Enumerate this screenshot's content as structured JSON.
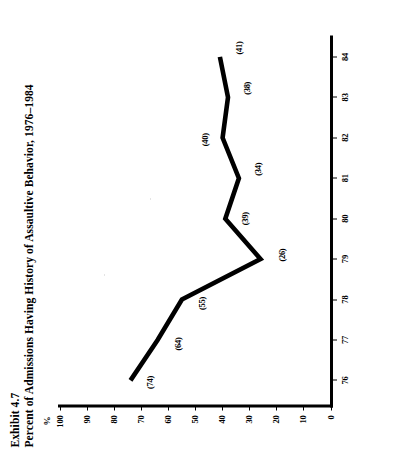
{
  "figure": {
    "exhibit_number": "Exhibit 4.7",
    "title": "Percent of Admissions Having History of Assaultive Behavior, 1976–1984",
    "y_axis_unit": "%"
  },
  "chart_data": {
    "type": "line",
    "title": "Percent of Admissions Having History of Assaultive Behavior, 1976–1984",
    "xlabel": "",
    "ylabel": "%",
    "categories": [
      "76",
      "77",
      "78",
      "79",
      "80",
      "81",
      "82",
      "83",
      "84"
    ],
    "x": [
      1976,
      1977,
      1978,
      1979,
      1980,
      1981,
      1982,
      1983,
      1984
    ],
    "values": [
      74,
      64,
      55,
      26,
      39,
      34,
      40,
      38,
      41
    ],
    "point_labels": [
      "(74)",
      "(64)",
      "(55)",
      "(26)",
      "(39)",
      "(34)",
      "(40)",
      "(38)",
      "(41)"
    ],
    "ylim": [
      0,
      100
    ],
    "y_ticks": [
      100,
      90,
      80,
      70,
      60,
      50,
      40,
      30,
      20,
      10,
      0
    ],
    "y_tick_labels": [
      "100",
      "90",
      "80",
      "70",
      "60",
      "50",
      "40",
      "30",
      "20",
      "10",
      "0"
    ],
    "x_tick_labels": [
      "76",
      "77",
      "78",
      "79",
      "80",
      "81",
      "82",
      "83",
      "84"
    ],
    "grid": false,
    "legend": false,
    "series_color": "#000000"
  }
}
